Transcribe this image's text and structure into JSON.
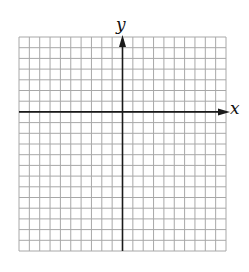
{
  "diagram": {
    "type": "coordinate-grid",
    "x_axis_label": "x",
    "y_axis_label": "y",
    "grid": {
      "columns": 20,
      "rows": 20,
      "origin_column": 10,
      "origin_row": 7,
      "left": 19,
      "top": 37,
      "right": 226,
      "bottom": 251
    },
    "colors": {
      "grid_line": "#a8a8a8",
      "axis": "#1a1a1a",
      "background": "#ffffff"
    }
  }
}
